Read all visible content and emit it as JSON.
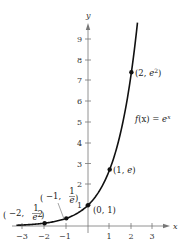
{
  "chart_data": {
    "type": "line",
    "title": "",
    "function_label": "f(x) = e^x",
    "function_label_parts": {
      "f": "f",
      "x_paren": "(x) = ",
      "base": "e",
      "exp": "x"
    },
    "xlabel": "x",
    "ylabel": "y",
    "xlim": [
      -3.3,
      3.4
    ],
    "ylim": [
      0,
      9.8
    ],
    "x_ticks": [
      -3,
      -2,
      -1,
      1,
      2,
      3
    ],
    "x_tick_labels": [
      "−3",
      "−2",
      "−1",
      "1",
      "2",
      "3"
    ],
    "y_ticks": [
      1,
      2,
      3,
      4,
      5,
      6,
      7,
      8,
      9
    ],
    "y_tick_labels": [
      "1",
      "2",
      "3",
      "4",
      "5",
      "6",
      "7",
      "8",
      "9"
    ],
    "grid": false,
    "series": [
      {
        "name": "f(x) = e^x",
        "x": [
          -3.3,
          -3,
          -2.5,
          -2,
          -1.5,
          -1,
          -0.5,
          0,
          0.5,
          1,
          1.5,
          2,
          2.2,
          2.28
        ],
        "y": [
          0.037,
          0.05,
          0.082,
          0.135,
          0.223,
          0.368,
          0.607,
          1.0,
          1.649,
          2.718,
          4.482,
          7.389,
          9.025,
          9.78
        ]
      }
    ],
    "points": [
      {
        "x": -2,
        "y": 0.135,
        "label": "(−2, 1/e²)"
      },
      {
        "x": -1,
        "y": 0.368,
        "label": "(−1, 1/e)"
      },
      {
        "x": 0,
        "y": 1,
        "label": "(0, 1)"
      },
      {
        "x": 1,
        "y": 2.718,
        "label": "(1, e)"
      },
      {
        "x": 2,
        "y": 7.389,
        "label": "(2, e²)"
      }
    ],
    "annotations": {
      "p_neg2": {
        "open": "(",
        "x": "−2, ",
        "num": "1",
        "den": "e",
        "den_exp": "2",
        "close": ")"
      },
      "p_neg1": {
        "open": "(",
        "x": "−1, ",
        "num": "1",
        "den": "e",
        "close": ")"
      },
      "p_0": "(0, 1)",
      "p_1_pre": "(1, ",
      "p_1_e": "e",
      "p_1_post": ")",
      "p_2_pre": "(2, ",
      "p_2_e": "e",
      "p_2_exp": "2",
      "p_2_post": ")"
    }
  }
}
